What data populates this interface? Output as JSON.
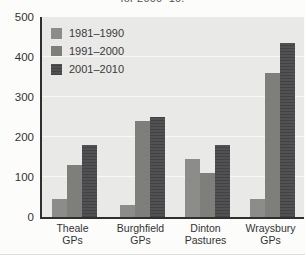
{
  "title_fragment": "for 2000–10.",
  "chart_data": {
    "type": "bar",
    "categories": [
      "Theale GPs",
      "Burghfield GPs",
      "Dinton Pastures",
      "Wraysbury GPs"
    ],
    "series": [
      {
        "name": "1981–1990",
        "color": "#8c8c8a",
        "values": [
          45,
          30,
          145,
          45
        ]
      },
      {
        "name": "1991–2000",
        "color": "#7e7f7b",
        "values": [
          130,
          240,
          110,
          360
        ]
      },
      {
        "name": "2001–2010",
        "color": "#515154",
        "values": [
          180,
          250,
          180,
          435
        ]
      }
    ],
    "xlabel": "",
    "ylabel": "",
    "ylim": [
      0,
      500
    ],
    "yticks": [
      0,
      100,
      200,
      300,
      400,
      500
    ],
    "grid": true,
    "legend_position": "top-left",
    "plot_background": "#e9e9e7",
    "axis_color": "#2f2f2f"
  }
}
